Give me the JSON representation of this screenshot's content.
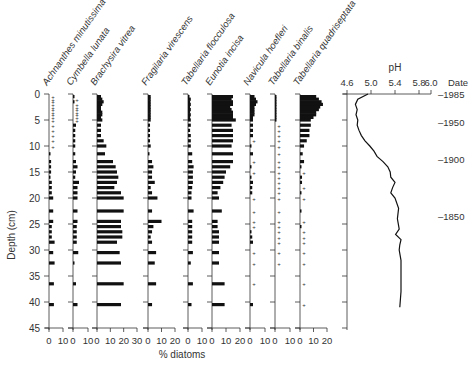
{
  "chart_data": {
    "type": "stratigraphic_bar",
    "title": "",
    "xlabel": "% diatoms",
    "ylabel": "Depth (cm)",
    "ylim": [
      0,
      45
    ],
    "y_ticks": [
      0,
      5,
      10,
      15,
      20,
      25,
      30,
      35,
      40,
      45
    ],
    "depths": [
      0.5,
      1,
      1.5,
      2,
      2.5,
      3,
      3.5,
      4,
      4.5,
      5,
      6,
      7,
      8,
      9,
      10,
      11.5,
      13,
      14,
      15,
      16,
      17,
      18,
      19,
      20,
      22.5,
      24.5,
      25.5,
      26.5,
      27.5,
      28.5,
      30.5,
      32.5,
      36.5,
      40.5
    ],
    "series": [
      {
        "name": "Achnanthes minutissima",
        "xlim": [
          0,
          10
        ],
        "x_ticks": [
          "0",
          "10"
        ],
        "values": [
          "+",
          "+",
          "+",
          "+",
          "+",
          "+",
          "+",
          "+",
          "+",
          "+",
          "+",
          "+",
          "+",
          "+",
          "+",
          1,
          1.5,
          1.5,
          1.5,
          1,
          2,
          2,
          2,
          3,
          3,
          3,
          2,
          2,
          2,
          4,
          3,
          4,
          3.5,
          3.5
        ]
      },
      {
        "name": "Cymbella lunata",
        "xlim": [
          0,
          10
        ],
        "x_ticks": [
          "0",
          "10"
        ],
        "values": [
          1,
          "+",
          1,
          "+",
          "+",
          "+",
          "+",
          "+",
          "+",
          "+",
          2,
          1.5,
          1.5,
          1.5,
          1.5,
          1.5,
          2,
          3,
          2,
          1.5,
          4,
          3,
          3,
          3,
          3,
          3,
          2.5,
          2.5,
          2.5,
          2.5,
          3.5,
          1,
          2,
          3
        ]
      },
      {
        "name": "Brachysira vitrea",
        "xlim": [
          0,
          30
        ],
        "x_ticks": [
          "0",
          "10",
          "20",
          "30"
        ],
        "values": [
          3,
          4,
          5,
          4,
          3,
          3,
          4,
          4,
          3,
          4,
          3,
          3,
          3,
          5,
          7,
          6,
          12,
          14,
          15,
          16,
          15,
          13,
          18,
          20,
          20,
          18,
          18,
          19,
          19,
          15,
          17,
          18,
          20,
          18
        ]
      },
      {
        "name": "Fragilaria virescens",
        "xlim": [
          0,
          20
        ],
        "x_ticks": [
          "0",
          "10",
          "20"
        ],
        "values": [
          2,
          2,
          2,
          2,
          2,
          2,
          2,
          2,
          2,
          2,
          1.5,
          1.5,
          1.5,
          1.5,
          2,
          1,
          3,
          4,
          3,
          3,
          5,
          2,
          3,
          7,
          3,
          10,
          4,
          3,
          2,
          3,
          6,
          5,
          6,
          3
        ]
      },
      {
        "name": "Tabellaria flocculosa",
        "xlim": [
          0,
          10
        ],
        "x_ticks": [
          "0",
          "10"
        ],
        "values": [
          1,
          2,
          1.5,
          2,
          1.5,
          2,
          1.5,
          2,
          1.5,
          2,
          2,
          1.5,
          2,
          2,
          2,
          3,
          3,
          4,
          3.5,
          3.5,
          3.5,
          3,
          2.5,
          2.5,
          4,
          3,
          3,
          3,
          3,
          3,
          3.5,
          2,
          3.5,
          2.5
        ]
      },
      {
        "name": "Eunotia incisa",
        "xlim": [
          0,
          20
        ],
        "x_ticks": [
          "0",
          "10",
          "20"
        ],
        "values": [
          15,
          14,
          15,
          15,
          13,
          14,
          15,
          15,
          15,
          17,
          14,
          15,
          15,
          15,
          14,
          15,
          15,
          13,
          10,
          9,
          8,
          6,
          4,
          5,
          7,
          4,
          4,
          5,
          5,
          5,
          5,
          5,
          9,
          9
        ]
      },
      {
        "name": "Navicula hoefleri",
        "xlim": [
          0,
          10
        ],
        "x_ticks": [
          "0",
          "10"
        ],
        "values": [
          3,
          4,
          5,
          4,
          3,
          3,
          3,
          3,
          2,
          2,
          2,
          2,
          2,
          "+",
          1,
          2,
          "+",
          1,
          "+",
          1,
          2,
          1.5,
          1.5,
          "+",
          "+",
          "+",
          "+",
          1,
          1.5,
          2,
          "+",
          "+",
          "+",
          2
        ]
      },
      {
        "name": "Tabellaria binalis",
        "xlim": [
          0,
          10
        ],
        "x_ticks": [
          "0",
          "10"
        ],
        "values": [
          1,
          1,
          1,
          1,
          1,
          1,
          1,
          1,
          1,
          1,
          "+",
          "+",
          "+",
          "+",
          "+",
          "+",
          "+",
          "+",
          "+",
          "+",
          "+",
          "+",
          "+",
          "+",
          "+",
          "+",
          "+",
          "+",
          "+",
          "+",
          "+",
          "+",
          "",
          ""
        ]
      },
      {
        "name": "Tabellaria quadriseptata",
        "xlim": [
          0,
          20
        ],
        "x_ticks": [
          "0",
          "10",
          "20"
        ],
        "values": [
          12,
          14,
          16,
          17,
          15,
          14,
          12,
          12,
          10,
          8,
          8,
          7,
          7,
          5,
          3,
          2,
          3,
          1,
          "+",
          1.5,
          1.5,
          "+",
          1,
          "+",
          1,
          "+",
          1,
          "+",
          "+",
          "+",
          "+",
          "+",
          "+",
          "+"
        ]
      }
    ],
    "ph_curve": {
      "label": "pH",
      "xlim": [
        4.6,
        6.0
      ],
      "x_ticks": [
        "4.6",
        "5.0",
        "5.4",
        "5.8",
        "6.0"
      ],
      "points": [
        [
          4.95,
          0
        ],
        [
          4.78,
          1
        ],
        [
          4.74,
          2
        ],
        [
          4.77,
          3
        ],
        [
          4.75,
          4
        ],
        [
          4.78,
          5
        ],
        [
          4.77,
          6
        ],
        [
          4.8,
          7
        ],
        [
          4.84,
          8
        ],
        [
          4.9,
          9
        ],
        [
          4.98,
          10
        ],
        [
          5.05,
          11
        ],
        [
          5.1,
          12
        ],
        [
          5.2,
          13
        ],
        [
          5.28,
          14
        ],
        [
          5.32,
          15
        ],
        [
          5.33,
          16
        ],
        [
          5.4,
          17
        ],
        [
          5.36,
          18
        ],
        [
          5.33,
          19
        ],
        [
          5.4,
          20
        ],
        [
          5.46,
          22
        ],
        [
          5.44,
          24
        ],
        [
          5.47,
          26
        ],
        [
          5.41,
          27
        ],
        [
          5.5,
          28
        ],
        [
          5.48,
          29
        ],
        [
          5.47,
          30
        ],
        [
          5.5,
          32
        ],
        [
          5.5,
          35
        ],
        [
          5.5,
          38
        ],
        [
          5.48,
          41
        ]
      ]
    },
    "date_axis": {
      "label": "Date",
      "ticks": [
        {
          "label": "1985",
          "depth": 0
        },
        {
          "label": "1950",
          "depth": 5.5
        },
        {
          "label": "1900",
          "depth": 12.5
        },
        {
          "label": "1850",
          "depth": 23.5
        }
      ]
    },
    "legend": "none",
    "grid": false
  }
}
